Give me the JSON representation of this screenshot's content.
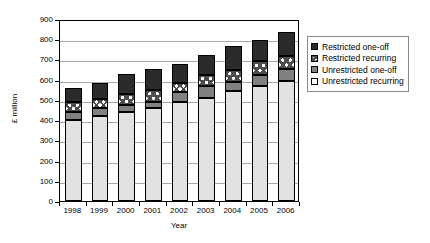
{
  "chart_data": {
    "type": "bar",
    "stacked": true,
    "title": "",
    "xlabel": "Year",
    "ylabel": "£ million",
    "ylim": [
      0,
      900
    ],
    "ytick_step": 100,
    "yticks": [
      "0",
      "100",
      "200",
      "300",
      "400",
      "500",
      "600",
      "700",
      "800",
      "900"
    ],
    "grid": true,
    "legend_position": "right",
    "categories": [
      "1998",
      "1999",
      "2000",
      "2001",
      "2002",
      "2003",
      "2004",
      "2005",
      "2006"
    ],
    "series": [
      {
        "name": "Unrestricted recurring",
        "color": "#e2e2e2",
        "values": [
          400,
          420,
          440,
          460,
          488,
          510,
          542,
          568,
          592
        ]
      },
      {
        "name": "Unrestricted one-off",
        "color": "#808080",
        "values": [
          40,
          38,
          35,
          30,
          52,
          58,
          46,
          54,
          60
        ]
      },
      {
        "name": "Restricted recurring",
        "color": "#4d4d4d",
        "values": [
          50,
          47,
          55,
          58,
          42,
          54,
          60,
          68,
          63
        ]
      },
      {
        "name": "Restricted one-off",
        "color": "#2b2b2b",
        "values": [
          68,
          77,
          98,
          107,
          98,
          98,
          118,
          108,
          120
        ]
      }
    ],
    "totals": [
      558,
      582,
      628,
      655,
      680,
      720,
      766,
      798,
      835
    ]
  },
  "legend": {
    "items": [
      {
        "label": "Restricted one-off",
        "swatch": "restricted-oneoff"
      },
      {
        "label": "Restricted recurring",
        "swatch": "restricted-recurring"
      },
      {
        "label": "Unrestricted one-off",
        "swatch": "unrestricted-oneoff"
      },
      {
        "label": "Unrestricted recurring",
        "swatch": "unrestricted-recurring"
      }
    ]
  }
}
